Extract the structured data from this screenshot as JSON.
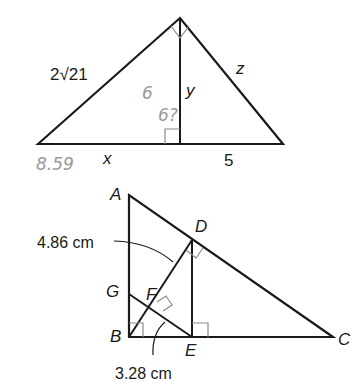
{
  "figure1": {
    "labels": {
      "hypotenuse_left": "2√21",
      "altitude": "y",
      "right_side": "z",
      "base_left": "x",
      "base_right": "5"
    },
    "handwritten": {
      "note_a": "6",
      "note_b": "6?",
      "note_c": "8.59"
    }
  },
  "figure2": {
    "points": {
      "A": "A",
      "B": "B",
      "C": "C",
      "D": "D",
      "E": "E",
      "F": "F",
      "G": "G"
    },
    "measurements": {
      "bd_length": "4.86 cm",
      "be_length": "3.28 cm"
    }
  },
  "colors": {
    "line": "#1a1a1a",
    "right_angle_mark": "#8a8a8a",
    "handwriting": "#9a9a9a"
  }
}
